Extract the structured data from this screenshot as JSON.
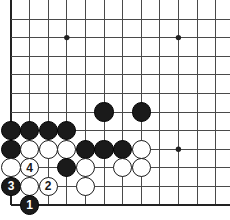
{
  "diagram": {
    "type": "go-board-diagram",
    "board": {
      "line_color": "#4a4a4a",
      "edge_color": "#222222",
      "background_color": "#ffffff",
      "origin_x": 11,
      "origin_y": 19,
      "spacing": 18.6,
      "columns": 12,
      "rows": 11,
      "left_edge_index": 0,
      "bottom_edge_index": 10,
      "edge_line_width": 2.6,
      "grid_line_width": 1.0
    },
    "star_points": [
      {
        "name": "star-point-upper-left",
        "col": 3,
        "row": 1
      },
      {
        "name": "star-point-upper-right",
        "col": 9,
        "row": 1
      },
      {
        "name": "star-point-lower-right",
        "col": 9,
        "row": 7
      }
    ],
    "stones": [
      {
        "name": "black-stone-f6",
        "color": "black",
        "col": 5,
        "row": 5,
        "label": ""
      },
      {
        "name": "black-stone-h6",
        "color": "black",
        "col": 7,
        "row": 5,
        "label": ""
      },
      {
        "name": "black-stone-a7",
        "color": "black",
        "col": 0,
        "row": 6,
        "label": ""
      },
      {
        "name": "black-stone-b7",
        "color": "black",
        "col": 1,
        "row": 6,
        "label": ""
      },
      {
        "name": "black-stone-c7",
        "color": "black",
        "col": 2,
        "row": 6,
        "label": ""
      },
      {
        "name": "black-stone-d7",
        "color": "black",
        "col": 3,
        "row": 6,
        "label": ""
      },
      {
        "name": "black-stone-a8",
        "color": "black",
        "col": 0,
        "row": 7,
        "label": ""
      },
      {
        "name": "white-stone-b8",
        "color": "white",
        "col": 1,
        "row": 7,
        "label": ""
      },
      {
        "name": "white-stone-c8",
        "color": "white",
        "col": 2,
        "row": 7,
        "label": ""
      },
      {
        "name": "white-stone-d8",
        "color": "white",
        "col": 3,
        "row": 7,
        "label": ""
      },
      {
        "name": "black-stone-e8",
        "color": "black",
        "col": 4,
        "row": 7,
        "label": ""
      },
      {
        "name": "black-stone-f8",
        "color": "black",
        "col": 5,
        "row": 7,
        "label": ""
      },
      {
        "name": "black-stone-g8",
        "color": "black",
        "col": 6,
        "row": 7,
        "label": ""
      },
      {
        "name": "white-stone-h8",
        "color": "white",
        "col": 7,
        "row": 7,
        "label": ""
      },
      {
        "name": "white-stone-a9",
        "color": "white",
        "col": 0,
        "row": 8,
        "label": ""
      },
      {
        "name": "white-stone-b9-move4",
        "color": "white",
        "col": 1,
        "row": 8,
        "label": "4"
      },
      {
        "name": "black-stone-d9",
        "color": "black",
        "col": 3,
        "row": 8,
        "label": ""
      },
      {
        "name": "white-stone-e9",
        "color": "white",
        "col": 4,
        "row": 8,
        "label": ""
      },
      {
        "name": "white-stone-g9",
        "color": "white",
        "col": 6,
        "row": 8,
        "label": ""
      },
      {
        "name": "white-stone-h9",
        "color": "white",
        "col": 7,
        "row": 8,
        "label": ""
      },
      {
        "name": "black-stone-a10-move3",
        "color": "black",
        "col": 0,
        "row": 9,
        "label": "3"
      },
      {
        "name": "white-stone-b10",
        "color": "white",
        "col": 1,
        "row": 9,
        "label": ""
      },
      {
        "name": "white-stone-c10-move2",
        "color": "white",
        "col": 2,
        "row": 9,
        "label": "2"
      },
      {
        "name": "white-stone-e10",
        "color": "white",
        "col": 4,
        "row": 9,
        "label": ""
      },
      {
        "name": "black-stone-b11-move1",
        "color": "black",
        "col": 1,
        "row": 10,
        "label": "1"
      }
    ],
    "move_sequence": [
      {
        "number": "1",
        "color": "black"
      },
      {
        "number": "2",
        "color": "white"
      },
      {
        "number": "3",
        "color": "black"
      },
      {
        "number": "4",
        "color": "white"
      }
    ]
  }
}
